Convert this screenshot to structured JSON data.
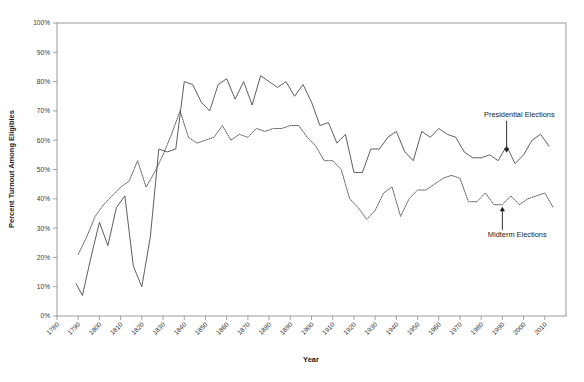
{
  "chart_data": {
    "type": "line",
    "title": "",
    "xlabel": "Year",
    "ylabel": "Percent Turnout Among Eligibles",
    "xlim": [
      1780,
      2020
    ],
    "ylim": [
      0,
      100
    ],
    "grid": false,
    "legend_position": "inline-annotations",
    "xticks": [
      1780,
      1790,
      1800,
      1810,
      1820,
      1830,
      1840,
      1850,
      1860,
      1870,
      1880,
      1890,
      1900,
      1910,
      1920,
      1930,
      1940,
      1950,
      1960,
      1970,
      1980,
      1990,
      2000,
      2010
    ],
    "xtick_labels": [
      "1780",
      "1790",
      "1800",
      "1810",
      "1820",
      "1830",
      "1840",
      "1850",
      "1860",
      "1870",
      "1880",
      "1890",
      "1900",
      "1910",
      "1920",
      "1930",
      "1940",
      "1950",
      "1960",
      "1970",
      "1980",
      "1990",
      "2000",
      "2010"
    ],
    "yticks": [
      0,
      10,
      20,
      30,
      40,
      50,
      60,
      70,
      80,
      90,
      100
    ],
    "ytick_labels": [
      "0%",
      "10%",
      "20%",
      "30%",
      "40%",
      "50%",
      "60%",
      "70%",
      "80%",
      "90%",
      "100%"
    ],
    "annotations": [
      {
        "text": "Presidential Elections",
        "target_x": 1992,
        "target_y": 55,
        "label_x": 1998,
        "label_y": 68
      },
      {
        "text": "Midterm Elections",
        "target_x": 1990,
        "target_y": 38,
        "label_x": 1997,
        "label_y": 27
      }
    ],
    "series": [
      {
        "name": "Presidential Elections",
        "style": "solid",
        "color": "#4d4d4d",
        "points": [
          [
            1789,
            11
          ],
          [
            1792,
            7
          ],
          [
            1796,
            20
          ],
          [
            1800,
            32
          ],
          [
            1804,
            24
          ],
          [
            1808,
            37
          ],
          [
            1812,
            41
          ],
          [
            1816,
            17
          ],
          [
            1820,
            10
          ],
          [
            1824,
            27
          ],
          [
            1828,
            57
          ],
          [
            1832,
            56
          ],
          [
            1836,
            57
          ],
          [
            1840,
            80
          ],
          [
            1844,
            79
          ],
          [
            1848,
            73
          ],
          [
            1852,
            70
          ],
          [
            1856,
            79
          ],
          [
            1860,
            81
          ],
          [
            1864,
            74
          ],
          [
            1868,
            80
          ],
          [
            1872,
            72
          ],
          [
            1876,
            82
          ],
          [
            1880,
            80
          ],
          [
            1884,
            78
          ],
          [
            1888,
            80
          ],
          [
            1892,
            75
          ],
          [
            1896,
            79
          ],
          [
            1900,
            73
          ],
          [
            1904,
            65
          ],
          [
            1908,
            66
          ],
          [
            1912,
            59
          ],
          [
            1916,
            62
          ],
          [
            1920,
            49
          ],
          [
            1924,
            49
          ],
          [
            1928,
            57
          ],
          [
            1932,
            57
          ],
          [
            1936,
            61
          ],
          [
            1940,
            63
          ],
          [
            1944,
            56
          ],
          [
            1948,
            53
          ],
          [
            1952,
            63
          ],
          [
            1956,
            61
          ],
          [
            1960,
            64
          ],
          [
            1964,
            62
          ],
          [
            1968,
            61
          ],
          [
            1972,
            56
          ],
          [
            1976,
            54
          ],
          [
            1980,
            54
          ],
          [
            1984,
            55
          ],
          [
            1988,
            53
          ],
          [
            1992,
            58
          ],
          [
            1996,
            52
          ],
          [
            2000,
            55
          ],
          [
            2004,
            60
          ],
          [
            2008,
            62
          ],
          [
            2012,
            58
          ]
        ]
      },
      {
        "name": "Midterm Elections",
        "style": "dotted",
        "color": "#4d4d4d",
        "points": [
          [
            1790,
            21
          ],
          [
            1794,
            27
          ],
          [
            1798,
            34
          ],
          [
            1802,
            38
          ],
          [
            1806,
            41
          ],
          [
            1810,
            44
          ],
          [
            1814,
            46
          ],
          [
            1818,
            53
          ],
          [
            1822,
            44
          ],
          [
            1826,
            49
          ],
          [
            1830,
            55
          ],
          [
            1834,
            62
          ],
          [
            1838,
            70
          ],
          [
            1842,
            61
          ],
          [
            1846,
            59
          ],
          [
            1850,
            60
          ],
          [
            1854,
            61
          ],
          [
            1858,
            65
          ],
          [
            1862,
            60
          ],
          [
            1866,
            62
          ],
          [
            1870,
            61
          ],
          [
            1874,
            64
          ],
          [
            1878,
            63
          ],
          [
            1882,
            64
          ],
          [
            1886,
            64
          ],
          [
            1890,
            65
          ],
          [
            1894,
            65
          ],
          [
            1898,
            61
          ],
          [
            1902,
            58
          ],
          [
            1906,
            53
          ],
          [
            1910,
            53
          ],
          [
            1914,
            50
          ],
          [
            1918,
            40
          ],
          [
            1922,
            37
          ],
          [
            1926,
            33
          ],
          [
            1930,
            36
          ],
          [
            1934,
            42
          ],
          [
            1938,
            44
          ],
          [
            1942,
            34
          ],
          [
            1946,
            40
          ],
          [
            1950,
            43
          ],
          [
            1954,
            43
          ],
          [
            1958,
            45
          ],
          [
            1962,
            47
          ],
          [
            1966,
            48
          ],
          [
            1970,
            47
          ],
          [
            1974,
            39
          ],
          [
            1978,
            39
          ],
          [
            1982,
            42
          ],
          [
            1986,
            38
          ],
          [
            1990,
            38
          ],
          [
            1994,
            41
          ],
          [
            1998,
            38
          ],
          [
            2002,
            40
          ],
          [
            2006,
            41
          ],
          [
            2010,
            42
          ],
          [
            2014,
            37
          ]
        ]
      }
    ]
  }
}
